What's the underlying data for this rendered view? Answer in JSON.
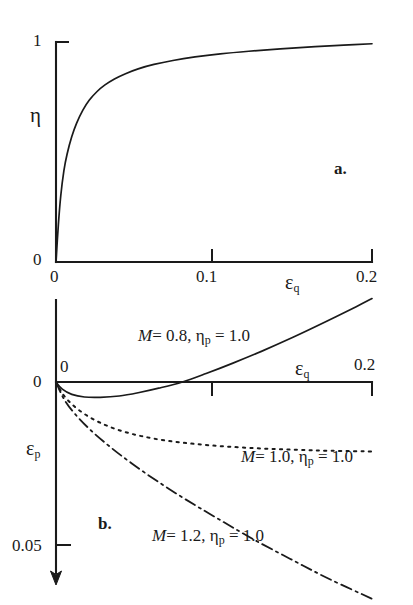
{
  "figure": {
    "caption_a": "a.",
    "caption_b": "b."
  },
  "chart_data": [
    {
      "id": "panel-a",
      "type": "line",
      "title": "",
      "xlabel": "εq",
      "ylabel": "η",
      "xlim": [
        0,
        0.2
      ],
      "ylim": [
        0,
        1
      ],
      "xticks": [
        0,
        0.1,
        0.2
      ],
      "xticklabels": [
        "0",
        "0.1",
        "0.2"
      ],
      "yticks": [
        0,
        1
      ],
      "yticklabels": [
        "0",
        "1"
      ],
      "grid": false,
      "legend": "none",
      "series": [
        {
          "name": "eta vs eps_q",
          "linestyle": "solid",
          "x": [
            0.0,
            0.0015,
            0.003,
            0.005,
            0.007,
            0.01,
            0.013,
            0.017,
            0.021,
            0.026,
            0.031,
            0.037,
            0.044,
            0.052,
            0.062,
            0.074,
            0.088,
            0.104,
            0.122,
            0.142,
            0.164,
            0.182,
            0.2
          ],
          "y": [
            0.0,
            0.17,
            0.3,
            0.415,
            0.49,
            0.57,
            0.63,
            0.69,
            0.735,
            0.775,
            0.805,
            0.832,
            0.856,
            0.878,
            0.898,
            0.916,
            0.932,
            0.946,
            0.958,
            0.969,
            0.979,
            0.986,
            0.992
          ]
        }
      ]
    },
    {
      "id": "panel-b",
      "type": "line",
      "title": "",
      "xlabel": "εq",
      "ylabel": "εp",
      "xlim": [
        0,
        0.2
      ],
      "ylim": [
        -0.035,
        0.062
      ],
      "y_axis_direction": "down",
      "xticks": [
        0,
        0.1,
        0.2
      ],
      "xticklabels": [
        "0",
        "0.1",
        "0.2"
      ],
      "yticks": [
        0,
        0.05
      ],
      "yticklabels": [
        "0",
        "0.05"
      ],
      "grid": false,
      "legend": "inline-annotations",
      "series": [
        {
          "name": "M = 0.8, ηp = 1.0",
          "label": "M = 0.8, ηp = 1.0",
          "linestyle": "solid",
          "x": [
            0.0,
            0.004,
            0.01,
            0.018,
            0.028,
            0.04,
            0.052,
            0.065,
            0.08,
            0.095,
            0.112,
            0.13,
            0.15,
            0.17,
            0.19,
            0.2
          ],
          "y": [
            0.0,
            0.0022,
            0.0038,
            0.0046,
            0.0047,
            0.0043,
            0.0033,
            0.0019,
            0.0,
            -0.0026,
            -0.0058,
            -0.0094,
            -0.0137,
            -0.0183,
            -0.0231,
            -0.0256
          ]
        },
        {
          "name": "M = 1.0, ηp = 1.0",
          "label": "M = 1.0, ηp = 1.0",
          "linestyle": "dotted",
          "x": [
            0.0,
            0.004,
            0.01,
            0.018,
            0.028,
            0.04,
            0.054,
            0.07,
            0.088,
            0.108,
            0.13,
            0.152,
            0.174,
            0.2
          ],
          "y": [
            0.0,
            0.0035,
            0.0068,
            0.0098,
            0.0125,
            0.0148,
            0.0166,
            0.018,
            0.019,
            0.0198,
            0.0204,
            0.0208,
            0.0211,
            0.0213
          ]
        },
        {
          "name": "M = 1.2, ηp = 1.0",
          "label": "M = 1.2, ηp = 1.0",
          "linestyle": "dashdot",
          "x": [
            0.0,
            0.005,
            0.012,
            0.022,
            0.034,
            0.048,
            0.064,
            0.082,
            0.102,
            0.124,
            0.148,
            0.172,
            0.2
          ],
          "y": [
            0.0,
            0.0052,
            0.0098,
            0.0148,
            0.0198,
            0.025,
            0.0304,
            0.036,
            0.0418,
            0.048,
            0.0542,
            0.0602,
            0.0665
          ]
        }
      ]
    }
  ],
  "panel_a": {
    "y_top_label": "1",
    "y_zero_label": "0",
    "y_axis_symbol": "η",
    "x_tick_0": "0",
    "x_tick_1": "0.1",
    "x_tick_2": "0.2",
    "x_axis_symbol": "ε",
    "x_axis_subscript": "q"
  },
  "panel_b": {
    "y_zero_label_left": "0",
    "y_zero_label_right": "0",
    "y_tick_005": "0.05",
    "y_axis_symbol": "ε",
    "y_axis_subscript": "p",
    "x_tick_2": "0.2",
    "x_axis_symbol": "ε",
    "x_axis_subscript": "q",
    "annotations": [
      {
        "m": "M",
        "eq1": "= 0.8,",
        "eta": "η",
        "etasub": "p",
        "eq2": "= 1.0"
      },
      {
        "m": "M",
        "eq1": "= 1.0,",
        "eta": "η",
        "etasub": "p",
        "eq2": "= 1.0"
      },
      {
        "m": "M",
        "eq1": "= 1.2,",
        "eta": "η",
        "etasub": "p",
        "eq2": "= 1.0"
      }
    ]
  }
}
